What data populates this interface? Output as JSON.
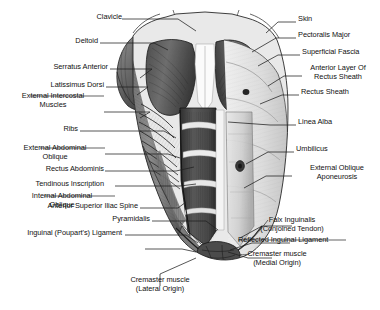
{
  "figure": {
    "background_color": "#ffffff",
    "ink_color": "#111111",
    "leader_line_color": "#2b2b2b",
    "style": "grayscale pencil/engraving rendering of male torso, dissected in layers"
  },
  "labels_left": [
    {
      "id": "clavicle",
      "text": "Clavicle"
    },
    {
      "id": "deltoid",
      "text": "Deltoid"
    },
    {
      "id": "serratus-anterior",
      "text": "Serratus Anterior"
    },
    {
      "id": "latissimus-dorsi",
      "text": "Latissimus Dorsi"
    },
    {
      "id": "external-intercostal-muscles",
      "text": "External Intercostal\nMuscles"
    },
    {
      "id": "ribs",
      "text": "Ribs"
    },
    {
      "id": "external-abdominal-oblique",
      "text": "External Abdominal\nOblique"
    },
    {
      "id": "rectus-abdominis",
      "text": "Rectus Abdominis"
    },
    {
      "id": "tendinous-inscription",
      "text": "Tendinous Inscription"
    },
    {
      "id": "internal-abdominal-oblique",
      "text": "Internal Abdominal\nOblique"
    },
    {
      "id": "anterior-superior-iliac-spine",
      "text": "Anterior Superior Iliac Spine"
    },
    {
      "id": "pyramidalis",
      "text": "Pyramidalis"
    },
    {
      "id": "inguinal-pouparts-ligament",
      "text": "Inguinal (Poupart's) Ligament"
    }
  ],
  "labels_right": [
    {
      "id": "skin",
      "text": "Skin"
    },
    {
      "id": "pectoralis-major",
      "text": "Pectoralis Major"
    },
    {
      "id": "superficial-fascia",
      "text": "Superficial Fascia"
    },
    {
      "id": "anterior-layer-of-rectus-sheath",
      "text": "Anterior Layer Of\nRectus Sheath"
    },
    {
      "id": "rectus-sheath",
      "text": "Rectus Sheath"
    },
    {
      "id": "linea-alba",
      "text": "Linea Alba"
    },
    {
      "id": "umbilicus",
      "text": "Umbilicus"
    },
    {
      "id": "external-oblique-aponeurosis",
      "text": "External Oblique\nAponeurosis"
    },
    {
      "id": "falx-inguinalis-conjoined-tendon",
      "text": "Falx Inguinalis\n(Conjoined Tendon)"
    },
    {
      "id": "reflected-inguinal-ligament",
      "text": "Reflected Inguinal Ligament"
    },
    {
      "id": "cremaster-muscle-medial-origin",
      "text": "Cremaster muscle\n(Medial Origin)"
    }
  ],
  "labels_bottom": [
    {
      "id": "cremaster-muscle-lateral-origin",
      "text": "Cremaster muscle\n(Lateral Origin)"
    }
  ]
}
